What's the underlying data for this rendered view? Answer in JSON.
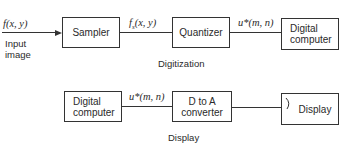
{
  "digitization": {
    "caption": "Digitization",
    "input_signal": "f(x, y)",
    "input_label_line1": "Input",
    "input_label_line2": "image",
    "sampler": "Sampler",
    "sampled_signal": "f_s(x, y)",
    "sampled_signal_main": "f",
    "sampled_signal_sub": "s",
    "sampled_signal_rest": "(x, y)",
    "quantizer": "Quantizer",
    "quantized_signal": "u*(m, n)",
    "computer_line1": "Digital",
    "computer_line2": "computer"
  },
  "display": {
    "caption": "Display",
    "computer_line1": "Digital",
    "computer_line2": "computer",
    "signal": "u*(m, n)",
    "converter_line1": "D to A",
    "converter_line2": "converter",
    "display_box": "Display"
  }
}
